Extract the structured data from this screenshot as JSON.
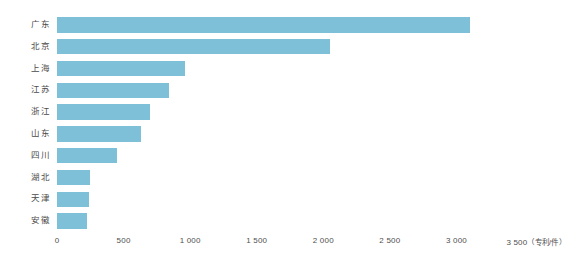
{
  "chart_data": {
    "type": "bar",
    "orientation": "horizontal",
    "title": "",
    "subtitle": "",
    "xlabel": "（专利/件）",
    "ylabel": "",
    "categories": [
      "广东",
      "北京",
      "上海",
      "江苏",
      "浙江",
      "山东",
      "四川",
      "湖北",
      "天津",
      "安徽"
    ],
    "values": [
      3100,
      2050,
      960,
      840,
      700,
      630,
      450,
      245,
      240,
      225
    ],
    "xlim": [
      0,
      3500
    ],
    "xticks": [
      0,
      500,
      1000,
      1500,
      2000,
      2500,
      3000,
      3500
    ],
    "xtick_labels": [
      "0",
      "500",
      "1 000",
      "1 500",
      "2 000",
      "2 500",
      "3 000",
      "3 500"
    ],
    "unit_label": "（专利/件）",
    "grid": false,
    "legend": "none",
    "series": [
      {
        "name": "专利数量",
        "values": [
          3100,
          2050,
          960,
          840,
          700,
          630,
          450,
          245,
          240,
          225
        ]
      }
    ],
    "bar_color": "#7fc0d9",
    "background_color": "#ffffff",
    "text_color": "#4a4a4a"
  }
}
